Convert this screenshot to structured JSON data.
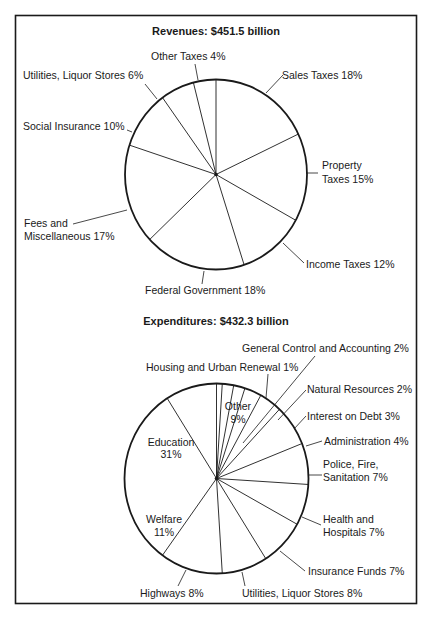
{
  "chart_data": [
    {
      "type": "pie",
      "title": "Revenues: $451.5 billion",
      "total": "$451.5 billion",
      "start_angle_deg": 0,
      "direction": "clockwise-from-top",
      "slices": [
        {
          "label": "Sales Taxes",
          "pct": 18,
          "text": "Sales Taxes 18%"
        },
        {
          "label": "Property Taxes",
          "pct": 15,
          "text": [
            "Property",
            "Taxes 15%"
          ]
        },
        {
          "label": "Income Taxes",
          "pct": 12,
          "text": "Income Taxes 12%"
        },
        {
          "label": "Federal Government",
          "pct": 18,
          "text": "Federal Government 18%"
        },
        {
          "label": "Fees and Miscellaneous",
          "pct": 17,
          "text": [
            "Fees and",
            "Miscellaneous 17%"
          ]
        },
        {
          "label": "Social Insurance",
          "pct": 10,
          "text": "Social Insurance 10%"
        },
        {
          "label": "Utilities, Liquor Stores",
          "pct": 6,
          "text": "Utilities, Liquor Stores 6%"
        },
        {
          "label": "Other Taxes",
          "pct": 4,
          "text": "Other Taxes 4%"
        }
      ],
      "categories": [
        "Sales Taxes",
        "Property Taxes",
        "Income Taxes",
        "Federal Government",
        "Fees and Miscellaneous",
        "Social Insurance",
        "Utilities, Liquor Stores",
        "Other Taxes"
      ],
      "values": [
        18,
        15,
        12,
        18,
        17,
        10,
        6,
        4
      ],
      "unit": "%"
    },
    {
      "type": "pie",
      "title": "Expenditures: $432.3 billion",
      "total": "$432.3 billion",
      "start_angle_deg": 0,
      "direction": "clockwise-from-top",
      "slices": [
        {
          "label": "Housing and Urban Renewal",
          "pct": 1,
          "text": "Housing and Urban Renewal 1%"
        },
        {
          "label": "General Control and Accounting",
          "pct": 2,
          "text": "General Control and Accounting 2%"
        },
        {
          "label": "Natural Resources",
          "pct": 2,
          "text": "Natural Resources 2%"
        },
        {
          "label": "Interest on Debt",
          "pct": 3,
          "text": "Interest on Debt 3%"
        },
        {
          "label": "Administration",
          "pct": 4,
          "text": "Administration 4%"
        },
        {
          "label": "Police, Fire, Sanitation",
          "pct": 7,
          "text": [
            "Police, Fire,",
            "Sanitation 7%"
          ]
        },
        {
          "label": "Health and Hospitals",
          "pct": 7,
          "text": [
            "Health and",
            "Hospitals 7%"
          ]
        },
        {
          "label": "Insurance Funds",
          "pct": 7,
          "text": "Insurance Funds 7%"
        },
        {
          "label": "Utilities, Liquor Stores",
          "pct": 8,
          "text": "Utilities, Liquor Stores 8%"
        },
        {
          "label": "Highways",
          "pct": 8,
          "text": "Highways 8%"
        },
        {
          "label": "Welfare",
          "pct": 11,
          "text": [
            "Welfare",
            "11%"
          ]
        },
        {
          "label": "Education",
          "pct": 31,
          "text": [
            "Education",
            "31%"
          ]
        },
        {
          "label": "Other",
          "pct": 9,
          "text": [
            "Other",
            "9%"
          ]
        }
      ],
      "categories": [
        "Housing and Urban Renewal",
        "General Control and Accounting",
        "Natural Resources",
        "Interest on Debt",
        "Administration",
        "Police, Fire, Sanitation",
        "Health and Hospitals",
        "Insurance Funds",
        "Utilities, Liquor Stores",
        "Highways",
        "Welfare",
        "Education",
        "Other"
      ],
      "values": [
        1,
        2,
        2,
        3,
        4,
        7,
        7,
        7,
        8,
        8,
        11,
        31,
        9
      ],
      "unit": "%"
    }
  ],
  "revenues": {
    "title": "Revenues: $451.5 billion",
    "labels": {
      "sales": "Sales Taxes 18%",
      "property_1": "Property",
      "property_2": "Taxes 15%",
      "income": "Income Taxes 12%",
      "federal": "Federal Government 18%",
      "fees_1": "Fees and",
      "fees_2": "Miscellaneous 17%",
      "social": "Social Insurance 10%",
      "utilities": "Utilities, Liquor Stores 6%",
      "other": "Other Taxes 4%"
    }
  },
  "expenditures": {
    "title": "Expenditures: $432.3 billion",
    "labels": {
      "gen_control": "General Control and Accounting  2%",
      "housing": "Housing and Urban Renewal  1%",
      "natural": "Natural Resources 2%",
      "interest": "Interest on Debt  3%",
      "admin": "Administration  4%",
      "police_1": "Police, Fire,",
      "police_2": "Sanitation  7%",
      "health_1": "Health and",
      "health_2": "Hospitals  7%",
      "insurance": "Insurance Funds  7%",
      "utilities": "Utilities, Liquor Stores 8%",
      "highways": "Highways  8%",
      "welfare_1": "Welfare",
      "welfare_2": "11%",
      "education_1": "Education",
      "education_2": "31%",
      "other_1": "Other",
      "other_2": "9%"
    }
  }
}
